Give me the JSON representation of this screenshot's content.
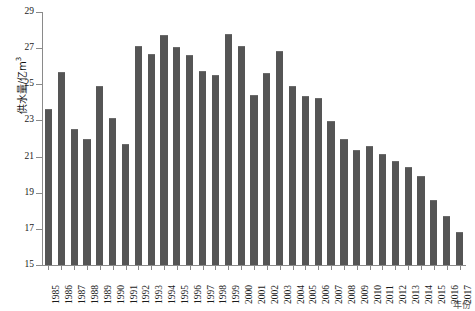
{
  "chart_data": {
    "type": "bar",
    "title": "",
    "subtitle": "",
    "xlabel": "年份",
    "ylabel": "供水量/亿m³",
    "ylabel_main": "供水量/亿m",
    "ylabel_exponent": "3",
    "ylim": [
      15,
      29
    ],
    "ytick_step": 2,
    "yticks": [
      15,
      17,
      19,
      21,
      23,
      25,
      27,
      29
    ],
    "ytick_labels": [
      "15",
      "17",
      "19",
      "21",
      "23",
      "25",
      "27",
      "29"
    ],
    "grid": false,
    "legend": null,
    "bar_color": "#555555",
    "axis_color": "#8a8a8a",
    "categories": [
      "1985",
      "1986",
      "1987",
      "1988",
      "1989",
      "1990",
      "1991",
      "1992",
      "1993",
      "1994",
      "1995",
      "1996",
      "1997",
      "1998",
      "1999",
      "2000",
      "2001",
      "2002",
      "2003",
      "2004",
      "2005",
      "2006",
      "2007",
      "2008",
      "2009",
      "2010",
      "2011",
      "2012",
      "2013",
      "2014",
      "2015",
      "2016",
      "2017"
    ],
    "values": [
      23.65,
      25.7,
      22.55,
      21.95,
      24.9,
      23.15,
      21.7,
      27.1,
      26.65,
      27.75,
      27.05,
      26.6,
      25.75,
      25.5,
      27.8,
      27.1,
      24.4,
      25.6,
      26.85,
      24.9,
      24.35,
      24.25,
      22.95,
      22.0,
      21.35,
      21.6,
      21.15,
      20.75,
      20.4,
      19.9,
      18.6,
      17.7,
      16.8
    ],
    "series": [
      {
        "name": "供水量",
        "values": [
          23.65,
          25.7,
          22.55,
          21.95,
          24.9,
          23.15,
          21.7,
          27.1,
          26.65,
          27.75,
          27.05,
          26.6,
          25.75,
          25.5,
          27.8,
          27.1,
          24.4,
          25.6,
          26.85,
          24.9,
          24.35,
          24.25,
          22.95,
          22.0,
          21.35,
          21.6,
          21.15,
          20.75,
          20.4,
          19.9,
          18.6,
          17.7,
          16.8
        ]
      }
    ],
    "max_value": 27.8,
    "max_category": "1999",
    "min_value": 16.8,
    "min_category": "2017"
  }
}
